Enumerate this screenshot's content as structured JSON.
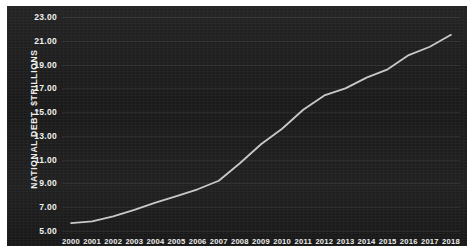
{
  "chart_data": {
    "type": "line",
    "title": "",
    "xlabel": "",
    "ylabel": "NATIONAL DEBT, $TRILLIONS",
    "x": [
      2000,
      2001,
      2002,
      2003,
      2004,
      2005,
      2006,
      2007,
      2008,
      2009,
      2010,
      2011,
      2012,
      2013,
      2014,
      2015,
      2016,
      2017,
      2018
    ],
    "categories": [
      "2000",
      "2001",
      "2002",
      "2003",
      "2004",
      "2005",
      "2006",
      "2007",
      "2008",
      "2009",
      "2010",
      "2011",
      "2012",
      "2013",
      "2014",
      "2015",
      "2016",
      "2017",
      "2018"
    ],
    "series": [
      {
        "name": "National debt",
        "values": [
          5.67,
          5.81,
          6.23,
          6.78,
          7.38,
          7.93,
          8.51,
          9.23,
          10.7,
          12.3,
          13.6,
          15.2,
          16.4,
          17.0,
          17.9,
          18.6,
          19.8,
          20.5,
          21.5
        ]
      }
    ],
    "ylim": [
      5.0,
      23.0
    ],
    "ytick_labels": [
      "23.00",
      "21.00",
      "19.00",
      "17.00",
      "15.00",
      "13.00",
      "11.00",
      "9.00",
      "7.00",
      "5.00"
    ],
    "ytick_values": [
      23.0,
      21.0,
      19.0,
      17.0,
      15.0,
      13.0,
      11.0,
      9.0,
      7.0,
      5.0
    ],
    "grid": true,
    "legend": "none",
    "colors": {
      "background": "#1b1b1b",
      "line": "#c9c9c9",
      "text": "#f0f0f0",
      "gridline": "#3a3a3a",
      "page": "#ffffff"
    },
    "line_width": 1.8
  }
}
